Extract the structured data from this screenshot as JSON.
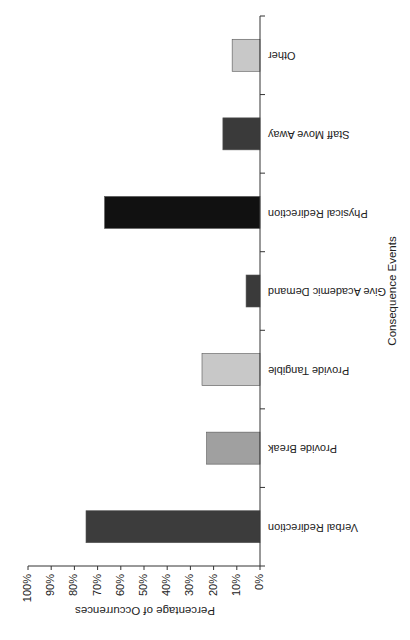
{
  "chart_data": {
    "type": "bar",
    "orientation": "rotated 90° clockwise (column chart rendered sideways)",
    "title": "",
    "xlabel": "Consequence Events",
    "ylabel": "Percentage of Occurrences",
    "ylim": [
      0,
      100
    ],
    "yticks": [
      "0%",
      "10%",
      "20%",
      "30%",
      "40%",
      "50%",
      "60%",
      "70%",
      "80%",
      "90%",
      "100%"
    ],
    "categories": [
      "Verbal Redirection",
      "Provide Break",
      "Provide Tangible",
      "Give Academic Demand",
      "Physical Redirection",
      "Staff Move Away",
      "Other"
    ],
    "values": [
      75,
      23,
      25,
      6,
      67,
      16,
      12
    ],
    "bar_colors": [
      "#3c3c3c",
      "#a0a0a0",
      "#c8c8c8",
      "#3a3a3a",
      "#111111",
      "#3a3a3a",
      "#c8c8c8"
    ],
    "grid": false,
    "legend": null
  }
}
